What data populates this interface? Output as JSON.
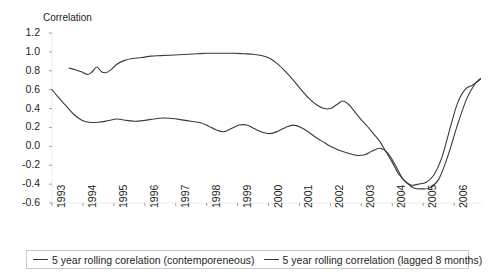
{
  "chart_data": {
    "type": "line",
    "title": "",
    "ylabel": "Correlation",
    "xlabel": "",
    "ylim": [
      -0.6,
      1.2
    ],
    "xlim": [
      1993.0,
      2006.9
    ],
    "grid": false,
    "legend_position": "bottom",
    "ytick_labels": [
      "1.2",
      "1.0",
      "0.8",
      "0.6",
      "0.4",
      "0.2",
      "0.0",
      "-0.2",
      "-0.4",
      "-0.6"
    ],
    "ytick_values": [
      1.2,
      1.0,
      0.8,
      0.6,
      0.4,
      0.2,
      0.0,
      -0.2,
      -0.4,
      -0.6
    ],
    "xtick_labels": [
      "1993",
      "1994",
      "1995",
      "1996",
      "1997",
      "1998",
      "1999",
      "2000",
      "2001",
      "2002",
      "2003",
      "2004",
      "2005",
      "2006"
    ],
    "xtick_values": [
      1993,
      1994,
      1995,
      1996,
      1997,
      1998,
      1999,
      2000,
      2001,
      2002,
      2003,
      2004,
      2005,
      2006
    ],
    "line_color": "#3a3a3a",
    "series": [
      {
        "name": "5 year rolling corelation (contemporeneous)",
        "x": [
          1993.55,
          1993.75,
          1993.95,
          1994.15,
          1994.3,
          1994.45,
          1994.6,
          1994.75,
          1994.9,
          1995.1,
          1995.35,
          1995.6,
          1995.9,
          1996.2,
          1996.5,
          1996.8,
          1997.1,
          1997.4,
          1997.7,
          1998.0,
          1998.3,
          1998.6,
          1998.9,
          1999.2,
          1999.5,
          1999.8,
          2000.05,
          2000.3,
          2000.55,
          2000.8,
          2001.05,
          2001.3,
          2001.55,
          2001.8,
          2002.0,
          2002.2,
          2002.4,
          2002.6,
          2002.8,
          2003.0,
          2003.2,
          2003.4,
          2003.6,
          2003.8,
          2004.0,
          2004.2,
          2004.45,
          2004.7,
          2004.95,
          2005.2,
          2005.5,
          2005.8,
          2006.1,
          2006.4,
          2006.65,
          2006.85
        ],
        "y": [
          0.83,
          0.81,
          0.79,
          0.76,
          0.79,
          0.84,
          0.79,
          0.78,
          0.81,
          0.87,
          0.91,
          0.93,
          0.94,
          0.955,
          0.96,
          0.965,
          0.97,
          0.975,
          0.98,
          0.985,
          0.985,
          0.985,
          0.985,
          0.98,
          0.975,
          0.96,
          0.93,
          0.87,
          0.79,
          0.7,
          0.6,
          0.51,
          0.44,
          0.4,
          0.4,
          0.44,
          0.48,
          0.44,
          0.36,
          0.28,
          0.21,
          0.13,
          0.05,
          -0.06,
          -0.17,
          -0.29,
          -0.38,
          -0.44,
          -0.45,
          -0.44,
          -0.35,
          -0.1,
          0.22,
          0.5,
          0.65,
          0.72
        ],
        "style": "solid"
      },
      {
        "name": "5 year rolling correlation (lagged 8 months)",
        "x": [
          1993.0,
          1993.2,
          1993.45,
          1993.7,
          1993.95,
          1994.2,
          1994.5,
          1994.8,
          1995.1,
          1995.4,
          1995.7,
          1996.0,
          1996.3,
          1996.6,
          1996.9,
          1997.2,
          1997.5,
          1997.8,
          1998.05,
          1998.3,
          1998.55,
          1998.8,
          1999.05,
          1999.3,
          1999.55,
          1999.8,
          2000.05,
          2000.3,
          2000.55,
          2000.8,
          2001.05,
          2001.3,
          2001.55,
          2001.8,
          2002.0,
          2002.2,
          2002.4,
          2002.6,
          2002.85,
          2003.1,
          2003.35,
          2003.6,
          2003.85,
          2004.1,
          2004.35,
          2004.6,
          2004.85,
          2005.1,
          2005.35,
          2005.6,
          2005.85,
          2006.1,
          2006.35,
          2006.6,
          2006.85
        ],
        "y": [
          0.6,
          0.52,
          0.43,
          0.34,
          0.28,
          0.255,
          0.255,
          0.27,
          0.29,
          0.275,
          0.265,
          0.275,
          0.29,
          0.3,
          0.295,
          0.28,
          0.265,
          0.25,
          0.215,
          0.175,
          0.155,
          0.19,
          0.225,
          0.225,
          0.185,
          0.15,
          0.135,
          0.16,
          0.2,
          0.225,
          0.2,
          0.15,
          0.09,
          0.04,
          0.0,
          -0.03,
          -0.055,
          -0.075,
          -0.095,
          -0.09,
          -0.05,
          -0.02,
          -0.07,
          -0.2,
          -0.35,
          -0.41,
          -0.4,
          -0.38,
          -0.3,
          -0.12,
          0.17,
          0.45,
          0.6,
          0.65,
          0.71
        ],
        "style": "solid"
      }
    ]
  },
  "legend": {
    "entries": [
      {
        "label": "5 year rolling corelation (contemporeneous)"
      },
      {
        "label": "5 year rolling correlation (lagged 8 months)"
      }
    ]
  }
}
